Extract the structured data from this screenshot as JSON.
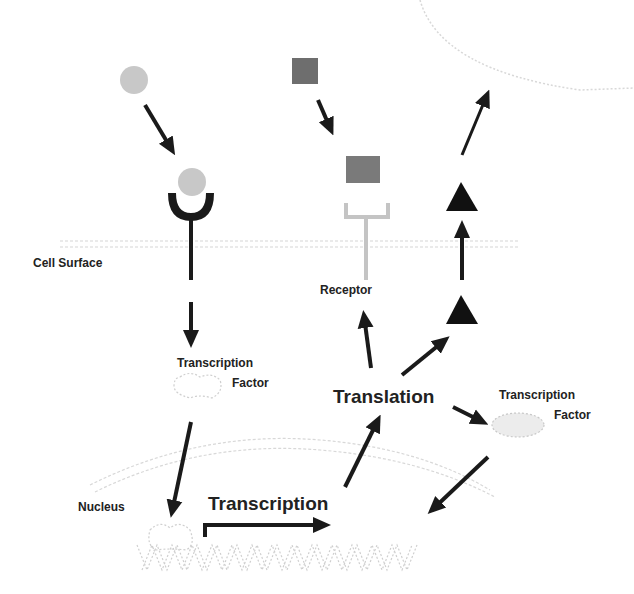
{
  "diagram": {
    "labels": {
      "cell_surface": "Cell Surface",
      "receptor": "Receptor",
      "transcription_factor_left_line1": "Transcription",
      "transcription_factor_left_line2": "Factor",
      "translation": "Translation",
      "transcription_factor_right_line1": "Transcription",
      "transcription_factor_right_line2": "Factor",
      "nucleus": "Nucleus",
      "transcription": "Transcription"
    },
    "colors": {
      "arrow": "#1a1a1a",
      "ligand_circle": "#c8c8c8",
      "ligand_square": "#6e6e6e",
      "receptor_dark": "#1a1a1a",
      "receptor_light": "#c4c4c4",
      "membrane": "#cfcfcf",
      "triangle": "#111111"
    },
    "nodes": [
      {
        "id": "circle-ligand",
        "shape": "circle"
      },
      {
        "id": "circle-ligand-bound",
        "shape": "circle"
      },
      {
        "id": "dark-receptor",
        "shape": "receptor"
      },
      {
        "id": "square-ligand",
        "shape": "square"
      },
      {
        "id": "square-ligand-bound",
        "shape": "square"
      },
      {
        "id": "light-receptor",
        "shape": "receptor"
      },
      {
        "id": "triangle-secreted-1",
        "shape": "triangle"
      },
      {
        "id": "triangle-secreted-2",
        "shape": "triangle"
      },
      {
        "id": "tf-inactive",
        "shape": "blob"
      },
      {
        "id": "tf-new",
        "shape": "ellipse"
      },
      {
        "id": "dna",
        "shape": "helix"
      }
    ]
  }
}
